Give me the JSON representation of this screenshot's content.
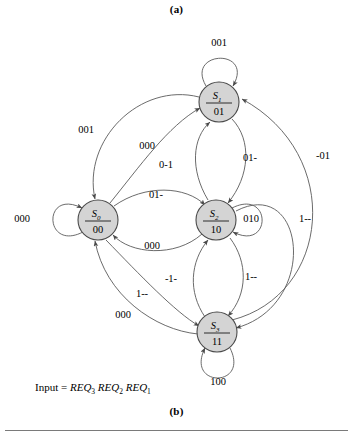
{
  "figure": {
    "panel_a_label": "(a)",
    "panel_b_label": "(b)",
    "caption_prefix": "Input = ",
    "caption_terms": [
      "REQ",
      "REQ",
      "REQ"
    ],
    "caption_subs": [
      "3",
      "2",
      "1"
    ],
    "node_fill": "#d4d4d4",
    "node_stroke": "#4a4a4a",
    "edge_stroke": "#5a5a5a"
  },
  "states": [
    {
      "id": "S0",
      "name": "S",
      "sub": "0",
      "code": "00",
      "cx": 98,
      "cy": 220,
      "r": 20
    },
    {
      "id": "S1",
      "name": "S",
      "sub": "1",
      "code": "01",
      "cx": 219,
      "cy": 102,
      "r": 20
    },
    {
      "id": "S2",
      "name": "S",
      "sub": "2",
      "code": "10",
      "cx": 216,
      "cy": 220,
      "r": 20
    },
    {
      "id": "S3",
      "name": "S",
      "sub": "3",
      "code": "11",
      "cx": 217,
      "cy": 332,
      "r": 20
    }
  ],
  "transitions": [
    {
      "from": "S1",
      "to": "S1",
      "label": "001",
      "lx": 219,
      "ly": 44
    },
    {
      "from": "S0",
      "to": "S0",
      "label": "000",
      "lx": 22,
      "ly": 220
    },
    {
      "from": "S2",
      "to": "S2",
      "label": "010",
      "lx": 251,
      "ly": 220
    },
    {
      "from": "S3",
      "to": "S3",
      "label": "100",
      "lx": 218,
      "ly": 383
    },
    {
      "from": "S1",
      "to": "S0",
      "label": "001",
      "lx": 86,
      "ly": 131
    },
    {
      "from": "S0",
      "to": "S1",
      "label": "000",
      "lx": 147,
      "ly": 147
    },
    {
      "from": "S2",
      "to": "S1",
      "label": "0-1",
      "lx": 166,
      "ly": 166
    },
    {
      "from": "S1",
      "to": "S2",
      "label": "01-",
      "lx": 250,
      "ly": 159
    },
    {
      "from": "S3",
      "to": "S1",
      "label": "-01",
      "lx": 323,
      "ly": 157
    },
    {
      "from": "S0",
      "to": "S2",
      "label": "01-",
      "lx": 156,
      "ly": 196
    },
    {
      "from": "S2",
      "to": "S0",
      "label": "000",
      "lx": 152,
      "ly": 247
    },
    {
      "from": "S3",
      "to": "S2",
      "label": "-1-",
      "lx": 171,
      "ly": 280
    },
    {
      "from": "S2",
      "to": "S3",
      "label": "1--",
      "lx": 251,
      "ly": 278
    },
    {
      "from": "S0",
      "to": "S3",
      "label": "1--",
      "lx": 142,
      "ly": 295
    },
    {
      "from": "S3",
      "to": "S0",
      "label": "000",
      "lx": 123,
      "ly": 316
    },
    {
      "from": "S0",
      "to": "S3",
      "label": "1--",
      "lx": 305,
      "ly": 220
    }
  ]
}
